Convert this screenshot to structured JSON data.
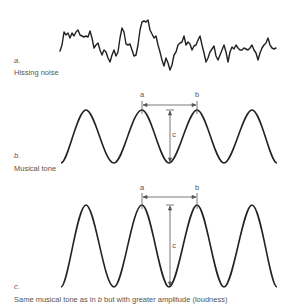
{
  "panels": {
    "a": {
      "letter": "a.",
      "caption": "Hissing noise",
      "waveform": "irregular-noise"
    },
    "b": {
      "letter": "b.",
      "caption": "Musical tone",
      "waveform": "sine",
      "cycles": 4,
      "markers": {
        "start": "a",
        "end": "b",
        "amplitude": "c"
      }
    },
    "c": {
      "letter": "c.",
      "caption_pre": "Same musical tone as in ",
      "caption_ref": "b",
      "caption_post": " but with greater amplitude (loudness)",
      "waveform": "sine",
      "cycles": 4,
      "markers": {
        "start": "a",
        "end": "b",
        "amplitude": "c"
      }
    }
  },
  "colors": {
    "wave": "#222222",
    "annotation": "#555555",
    "text": "#555555"
  }
}
